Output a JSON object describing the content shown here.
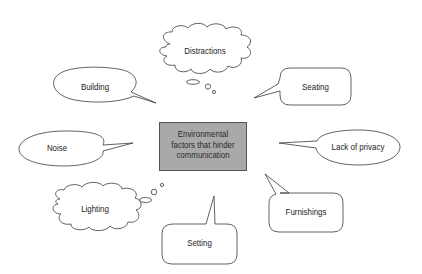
{
  "diagram": {
    "center": {
      "lines": [
        "Environmental",
        "factors that hinder",
        "communication"
      ],
      "fill": "#a9a9a9",
      "border": "#555555"
    },
    "factors": [
      {
        "id": "distractions",
        "label": "Distractions",
        "shape": "thought-cloud"
      },
      {
        "id": "building",
        "label": "Building",
        "shape": "oval-speech-bubble"
      },
      {
        "id": "seating",
        "label": "Seating",
        "shape": "rounded-speech-bubble"
      },
      {
        "id": "noise",
        "label": "Noise",
        "shape": "oval-speech-bubble"
      },
      {
        "id": "lack-of-privacy",
        "label": "Lack of privacy",
        "shape": "oval-speech-bubble"
      },
      {
        "id": "lighting",
        "label": "Lighting",
        "shape": "thought-cloud"
      },
      {
        "id": "furnishings",
        "label": "Furnishings",
        "shape": "rounded-speech-bubble"
      },
      {
        "id": "setting",
        "label": "Setting",
        "shape": "rounded-speech-bubble"
      }
    ]
  }
}
